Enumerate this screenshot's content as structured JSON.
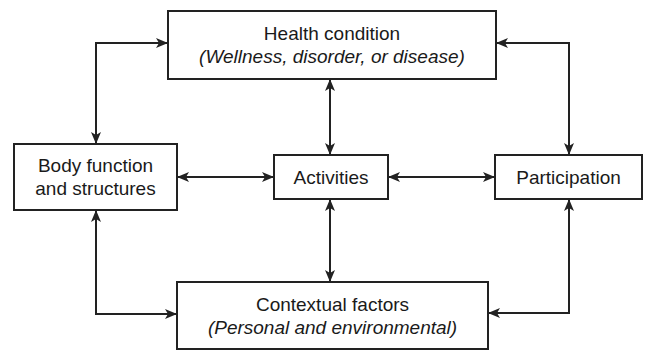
{
  "diagram": {
    "nodes": {
      "health": {
        "title": "Health condition",
        "subtitle": "(Wellness, disorder, or disease)"
      },
      "body": {
        "line1": "Body function",
        "line2": "and structures"
      },
      "activities": {
        "title": "Activities"
      },
      "participation": {
        "title": "Participation"
      },
      "contextual": {
        "title": "Contextual factors",
        "subtitle": "(Personal and environmental)"
      }
    },
    "edges": [
      {
        "from": "health",
        "to": "body",
        "bidirectional": true
      },
      {
        "from": "health",
        "to": "activities",
        "bidirectional": true
      },
      {
        "from": "health",
        "to": "participation",
        "bidirectional": true
      },
      {
        "from": "body",
        "to": "activities",
        "bidirectional": true
      },
      {
        "from": "activities",
        "to": "participation",
        "bidirectional": true
      },
      {
        "from": "body",
        "to": "contextual",
        "bidirectional": true
      },
      {
        "from": "activities",
        "to": "contextual",
        "bidirectional": true
      },
      {
        "from": "participation",
        "to": "contextual",
        "bidirectional": true
      }
    ],
    "colors": {
      "line": "#222222",
      "background": "#ffffff"
    }
  }
}
